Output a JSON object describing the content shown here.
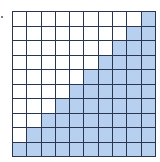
{
  "diagram": {
    "type": "grid",
    "rows": 10,
    "cols": 10,
    "shaded_per_row_from_right": [
      1,
      2,
      3,
      4,
      5,
      6,
      7,
      8,
      9,
      10
    ],
    "shaded_total": 55,
    "total_cells": 100,
    "colors": {
      "shaded": "#b8d0f0",
      "unshaded": "#ffffff",
      "grid_line": "#2a3550"
    }
  }
}
